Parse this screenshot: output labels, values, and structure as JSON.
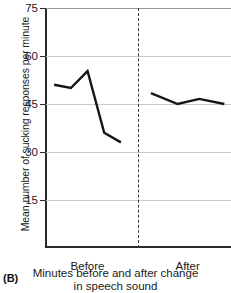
{
  "panel": {
    "label": "(B)"
  },
  "chart_data": {
    "type": "line",
    "title": "",
    "xlabel_lines": [
      "Minutes before and after change",
      "in speech sound"
    ],
    "ylabel": "Mean number of sucking responses per minute",
    "ylim": [
      0,
      75
    ],
    "yticks": [
      75,
      60,
      45,
      30,
      15
    ],
    "ytick_labels": [
      "75",
      "60",
      "45",
      "30",
      "15"
    ],
    "grid": true,
    "legend": "none",
    "categories": [
      "Before",
      "After"
    ],
    "annotations": [
      {
        "name": "phase-divider",
        "type": "vertical-dashed-line",
        "x": 5.0,
        "label": ""
      }
    ],
    "series": [
      {
        "name": "Before",
        "points": [
          {
            "x": 0.0,
            "y": 51.0
          },
          {
            "x": 1.0,
            "y": 50.0
          },
          {
            "x": 2.0,
            "y": 55.3
          },
          {
            "x": 3.0,
            "y": 36.0
          },
          {
            "x": 4.0,
            "y": 33.0
          }
        ]
      },
      {
        "name": "After",
        "points": [
          {
            "x": 5.8,
            "y": 48.4
          },
          {
            "x": 7.4,
            "y": 45.0
          },
          {
            "x": 8.7,
            "y": 46.6
          },
          {
            "x": 10.2,
            "y": 45.0
          }
        ]
      }
    ]
  }
}
